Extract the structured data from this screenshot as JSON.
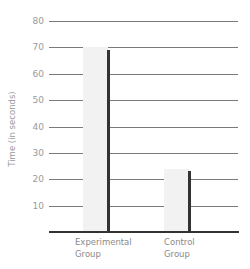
{
  "chart_data": {
    "type": "bar",
    "title": "",
    "xlabel": "",
    "ylabel": "Time (in seconds)",
    "ylim": [
      0,
      80
    ],
    "yticks": [
      10,
      20,
      30,
      40,
      50,
      60,
      70,
      80
    ],
    "grid": true,
    "categories": [
      "Experimental Group",
      "Control Group"
    ],
    "category_lines": [
      [
        "Experimental",
        "Group"
      ],
      [
        "Control",
        "Group"
      ]
    ],
    "series": [
      {
        "name": "light",
        "color": "#f2f2f2",
        "values": [
          70,
          24
        ]
      },
      {
        "name": "dark",
        "color": "#333333",
        "values": [
          69,
          23
        ]
      }
    ],
    "legend": null
  },
  "colors": {
    "grid": "#7a7a7a",
    "axis": "#333333",
    "text": "#8a8a8a"
  }
}
